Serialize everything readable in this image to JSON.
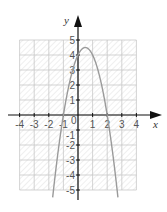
{
  "chart_data": {
    "type": "line",
    "title": "",
    "xlabel": "x",
    "ylabel": "y",
    "xlim": [
      -4,
      4
    ],
    "ylim": [
      -5,
      5
    ],
    "grid": true,
    "grid_fill": "hatched",
    "x_ticks": [
      "-4",
      "-3",
      "-2",
      "-1",
      "1",
      "2",
      "3",
      "4"
    ],
    "y_ticks": [
      "5",
      "4",
      "3",
      "2",
      "1",
      "-1",
      "-2",
      "-3",
      "-4",
      "-5"
    ],
    "origin_label": "0",
    "series": [
      {
        "name": "parabola",
        "equation": "y = -2x^2 + 2x + 4",
        "x": [
          -1.7,
          -1.5,
          -1.0,
          -0.5,
          0,
          0.5,
          1.0,
          1.5,
          2.0,
          2.5,
          2.7
        ],
        "y": [
          -5.18,
          -3.5,
          0,
          2.5,
          4,
          4.5,
          4,
          2.5,
          0,
          -3.5,
          -5.18
        ],
        "vertex": [
          0.5,
          4.5
        ],
        "roots": [
          -1,
          2
        ],
        "y_intercept": 4,
        "color": "#9a9a9a"
      }
    ]
  },
  "colors": {
    "axis": "#111111",
    "grid": "#c8c8c8",
    "hatch": "#dcdcdc",
    "curve": "#9a9a9a"
  }
}
